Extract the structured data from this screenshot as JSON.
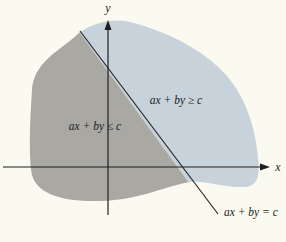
{
  "figure": {
    "colors": {
      "background": "#fbfaf0",
      "region_ge": "#c7d2da",
      "region_le": "#a9a8a3",
      "ink": "#1e1e1e"
    },
    "axes": {
      "x_label": "x",
      "y_label": "y"
    },
    "line": {
      "label": "ax + by = c"
    },
    "regions": [
      {
        "id": "ge",
        "label": "ax + by ≥ c"
      },
      {
        "id": "le",
        "label": "ax + by ≤ c"
      }
    ]
  }
}
